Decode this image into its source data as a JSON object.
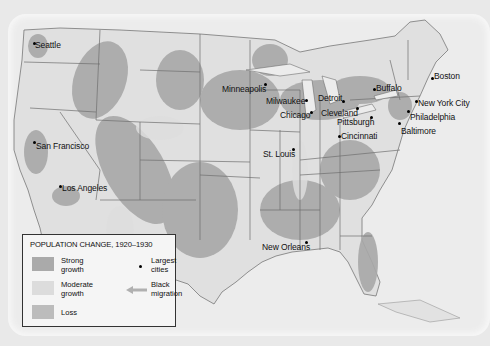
{
  "map": {
    "title": "POPULATION CHANGE, 1920–1930",
    "colors": {
      "strong_growth": "#a9a9a9",
      "moderate_growth": "#d9d9d9",
      "loss": "#bdbdbd",
      "land": "#e2e2e2",
      "water": "#ececec",
      "border": "#6e6e6e"
    },
    "legend": {
      "title": "POPULATION CHANGE, 1920–1930",
      "items": [
        {
          "label_line1": "Strong",
          "label_line2": "growth"
        },
        {
          "label_line1": "Moderate",
          "label_line2": "growth"
        },
        {
          "label_line1": "Loss",
          "label_line2": ""
        }
      ],
      "symbols": [
        {
          "icon": "city-dot-icon",
          "label_line1": "Largest",
          "label_line2": "cities"
        },
        {
          "icon": "migration-arrow-icon",
          "label_line1": "Black",
          "label_line2": "migration"
        }
      ]
    },
    "cities": [
      {
        "name": "Seattle"
      },
      {
        "name": "San Francisco"
      },
      {
        "name": "Los Angeles"
      },
      {
        "name": "Minneapolis"
      },
      {
        "name": "Milwaukee"
      },
      {
        "name": "Chicago"
      },
      {
        "name": "St. Louis"
      },
      {
        "name": "Detroit"
      },
      {
        "name": "Cleveland"
      },
      {
        "name": "Pittsburgh"
      },
      {
        "name": "Cincinnati"
      },
      {
        "name": "Buffalo"
      },
      {
        "name": "Boston"
      },
      {
        "name": "New York City"
      },
      {
        "name": "Philadelphia"
      },
      {
        "name": "Baltimore"
      },
      {
        "name": "New Orleans"
      }
    ]
  }
}
